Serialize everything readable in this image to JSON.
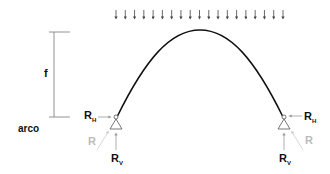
{
  "diagram": {
    "type_label": "arco",
    "rise_label": "f",
    "left_support": {
      "RH": "R",
      "RH_sub": "H",
      "RV": "R",
      "RV_sub": "V",
      "R": "R"
    },
    "right_support": {
      "RH": "R",
      "RH_sub": "H",
      "RV": "R",
      "RV_sub": "V",
      "R": "R"
    },
    "load": {
      "arrow_count": 19,
      "x_start": 116,
      "x_end": 283
    },
    "colors": {
      "line": "#111111",
      "dim": "#888888",
      "resultant": "#bbbbbb"
    }
  }
}
